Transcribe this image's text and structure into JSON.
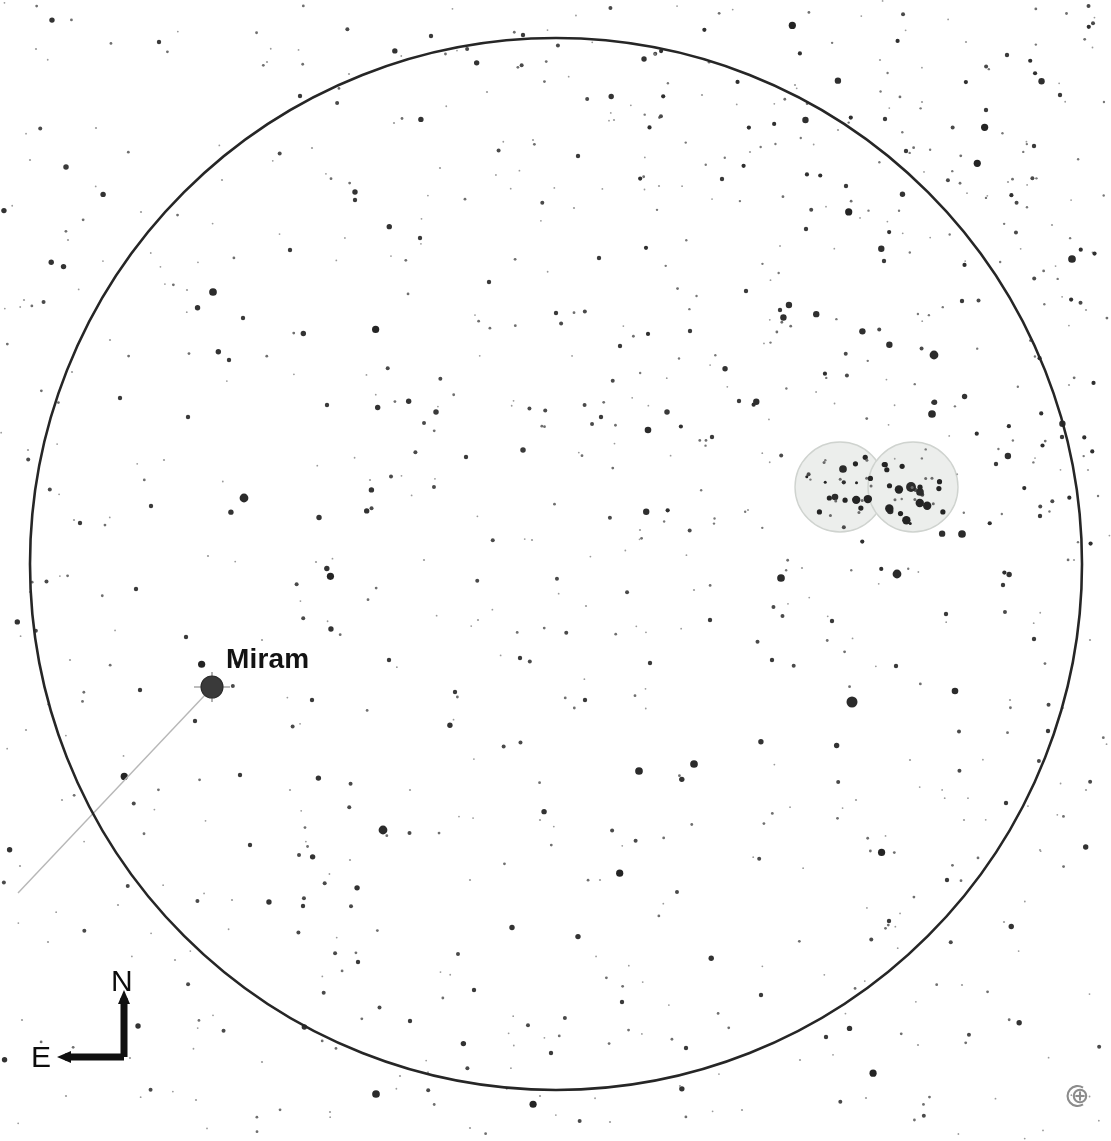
{
  "chart": {
    "type": "star-chart",
    "title_cut_off": "A simple chart of the region, projected looking up",
    "background_color": "#ffffff",
    "ink_color": "#1a1a1a",
    "field_of_view_circle": {
      "label": "field-of-view-circle",
      "center_x": 556,
      "center_y": 564,
      "radius": 526,
      "stroke_color": "#262626",
      "stroke_width": 2.6
    },
    "labeled_stars": [
      {
        "name": "Miram",
        "x": 212,
        "y": 687,
        "radius": 11,
        "magnitude_rank": 1,
        "has_spikes": true,
        "color": "#3a3a3a"
      }
    ],
    "constellation_lines": [
      {
        "name": "miram-line",
        "x1": 205,
        "y1": 695,
        "x2": 18,
        "y2": 893,
        "color": "#b7b7b7",
        "width": 1.4
      }
    ],
    "deep_sky_objects": [
      {
        "name": "open-cluster-west",
        "shape": "circle",
        "x": 840,
        "y": 487,
        "radius": 45,
        "fill": "#eceeec",
        "stroke": "#cfd3cf"
      },
      {
        "name": "open-cluster-east",
        "shape": "circle",
        "x": 913,
        "y": 487,
        "radius": 45,
        "fill": "#eceeec",
        "stroke": "#cfd3cf"
      }
    ],
    "compass": {
      "north_label": "N",
      "east_label": "E",
      "corner_x": 124,
      "corner_y": 1057,
      "north_tip_y": 990,
      "east_tip_x": 57,
      "stroke_color": "#101010",
      "stroke_width": 7
    },
    "zoom_icon": {
      "name": "zoom-target-icon",
      "glyph": "target-plus",
      "color": "#8c8c8c"
    },
    "star_field": {
      "description": "Monochrome plotted star field; dot radius encodes magnitude.",
      "dot_color": "#2b2b2b",
      "faint_dot_color": "#9a9a9a",
      "count": 620
    }
  },
  "chart_data": {
    "type": "scatter",
    "xlabel": "Right Ascension (E left)",
    "ylabel": "Declination (N up)",
    "grid": false,
    "legend": "none",
    "xlim": [
      0,
      1111
    ],
    "ylim": [
      0,
      1141
    ],
    "annotations": [
      "Miram",
      "N",
      "E"
    ],
    "series": [
      {
        "name": "bright-stars",
        "marker": "filled-circle",
        "points": [
          [
            212,
            687,
            11
          ],
          [
            852,
            702,
            10
          ],
          [
            383,
            830,
            8
          ],
          [
            897,
            574,
            8
          ],
          [
            781,
            578,
            7
          ],
          [
            934,
            355,
            8
          ],
          [
            932,
            414,
            7
          ],
          [
            694,
            764,
            7
          ],
          [
            639,
            771,
            7
          ],
          [
            1072,
            259,
            7
          ],
          [
            244,
            498,
            8
          ],
          [
            213,
            292,
            7
          ],
          [
            376,
            1094,
            7
          ],
          [
            962,
            534,
            7
          ],
          [
            955,
            691,
            6
          ],
          [
            648,
            430,
            6
          ],
          [
            843,
            469,
            7
          ],
          [
            911,
            487,
            9
          ],
          [
            920,
            492,
            7
          ],
          [
            835,
            497,
            6
          ]
        ]
      },
      {
        "name": "medium-stars",
        "marker": "filled-circle",
        "points": [
          [
            66,
            167,
            5
          ],
          [
            159,
            42,
            4
          ],
          [
            229,
            360,
            4
          ],
          [
            327,
            405,
            4
          ],
          [
            436,
            412,
            5
          ],
          [
            466,
            457,
            4
          ],
          [
            523,
            450,
            5
          ],
          [
            601,
            417,
            4
          ],
          [
            667,
            412,
            5
          ],
          [
            712,
            437,
            4
          ],
          [
            739,
            401,
            4
          ],
          [
            780,
            310,
            4
          ],
          [
            722,
            179,
            4
          ],
          [
            846,
            186,
            4
          ],
          [
            885,
            119,
            4
          ],
          [
            906,
            151,
            4
          ],
          [
            986,
            110,
            4
          ],
          [
            1007,
            55,
            4
          ],
          [
            1034,
            146,
            4
          ],
          [
            1060,
            95,
            4
          ],
          [
            599,
            258,
            4
          ],
          [
            578,
            156,
            4
          ],
          [
            523,
            35,
            4
          ],
          [
            431,
            36,
            4
          ],
          [
            300,
            96,
            4
          ],
          [
            120,
            398,
            4
          ],
          [
            80,
            523,
            4
          ],
          [
            186,
            637,
            4
          ],
          [
            140,
            690,
            4
          ],
          [
            250,
            845,
            4
          ],
          [
            303,
            906,
            4
          ],
          [
            358,
            962,
            4
          ],
          [
            410,
            1021,
            4
          ],
          [
            474,
            990,
            4
          ],
          [
            551,
            1053,
            4
          ],
          [
            622,
            1002,
            4
          ],
          [
            686,
            1048,
            4
          ],
          [
            761,
            995,
            4
          ],
          [
            826,
            1037,
            4
          ],
          [
            889,
            921,
            4
          ],
          [
            947,
            880,
            4
          ],
          [
            1006,
            803,
            4
          ],
          [
            1048,
            731,
            4
          ],
          [
            1034,
            639,
            4
          ],
          [
            996,
            464,
            4
          ],
          [
            962,
            301,
            4
          ],
          [
            884,
            261,
            4
          ],
          [
            806,
            229,
            4
          ],
          [
            746,
            291,
            4
          ],
          [
            690,
            331,
            4
          ],
          [
            620,
            346,
            4
          ],
          [
            556,
            313,
            4
          ],
          [
            489,
            282,
            4
          ],
          [
            420,
            238,
            4
          ],
          [
            355,
            200,
            4
          ],
          [
            290,
            250,
            4
          ],
          [
            243,
            318,
            4
          ],
          [
            188,
            417,
            4
          ],
          [
            151,
            506,
            4
          ],
          [
            136,
            589,
            4
          ],
          [
            195,
            721,
            4
          ],
          [
            240,
            775,
            4
          ],
          [
            312,
            700,
            4
          ],
          [
            389,
            660,
            4
          ],
          [
            455,
            692,
            4
          ],
          [
            520,
            658,
            4
          ],
          [
            585,
            700,
            4
          ],
          [
            650,
            663,
            4
          ],
          [
            710,
            620,
            4
          ],
          [
            772,
            660,
            4
          ],
          [
            832,
            621,
            4
          ],
          [
            896,
            666,
            4
          ],
          [
            946,
            614,
            4
          ],
          [
            1003,
            585,
            4
          ],
          [
            1040,
            516,
            4
          ],
          [
            1062,
            437,
            4
          ]
        ]
      },
      {
        "name": "faint-stars",
        "marker": "dot",
        "points": [
          [
            36,
            49,
            2
          ],
          [
            96,
            128,
            2
          ],
          [
            141,
            212,
            2
          ],
          [
            187,
            290,
            2
          ],
          [
            222,
            180,
            2
          ],
          [
            267,
            62,
            2
          ],
          [
            312,
            148,
            2
          ],
          [
            349,
            74,
            2
          ],
          [
            394,
            123,
            2
          ],
          [
            440,
            168,
            2
          ],
          [
            487,
            92,
            2
          ],
          [
            533,
            140,
            2
          ],
          [
            574,
            208,
            2
          ],
          [
            614,
            120,
            2
          ],
          [
            659,
            186,
            2
          ],
          [
            702,
            95,
            2
          ],
          [
            750,
            152,
            2
          ],
          [
            795,
            85,
            2
          ],
          [
            838,
            130,
            2
          ],
          [
            880,
            60,
            2
          ],
          [
            922,
            102,
            2
          ],
          [
            966,
            42,
            2
          ],
          [
            1008,
            182,
            2
          ],
          [
            1052,
            225,
            2
          ],
          [
            1086,
            310,
            2
          ],
          [
            1069,
            385,
            2
          ],
          [
            1088,
            470,
            2
          ],
          [
            1074,
            560,
            2
          ],
          [
            1090,
            640,
            2
          ],
          [
            1063,
            708,
            2
          ],
          [
            1086,
            790,
            2
          ],
          [
            1040,
            850,
            2
          ],
          [
            1004,
            922,
            2
          ],
          [
            962,
            985,
            2
          ],
          [
            918,
            1045,
            2
          ],
          [
            866,
            1098,
            2
          ],
          [
            800,
            1060,
            2
          ],
          [
            742,
            1110,
            2
          ],
          [
            680,
            1086,
            2
          ],
          [
            610,
            1122,
            2
          ],
          [
            540,
            1096,
            2
          ],
          [
            470,
            1128,
            2
          ],
          [
            400,
            1076,
            2
          ],
          [
            330,
            1112,
            2
          ],
          [
            262,
            1062,
            2
          ],
          [
            196,
            1100,
            2
          ],
          [
            130,
            1058,
            2
          ],
          [
            66,
            1096,
            2
          ],
          [
            22,
            1020,
            2
          ],
          [
            48,
            942,
            2
          ],
          [
            20,
            866,
            2
          ],
          [
            62,
            800,
            2
          ],
          [
            26,
            730,
            2
          ],
          [
            70,
            660,
            2
          ],
          [
            30,
            592,
            2
          ],
          [
            74,
            520,
            2
          ],
          [
            28,
            450,
            2
          ],
          [
            72,
            372,
            2
          ],
          [
            24,
            300,
            2
          ],
          [
            68,
            240,
            2
          ],
          [
            30,
            160,
            2
          ],
          [
            110,
            340,
            2
          ],
          [
            164,
            460,
            2
          ],
          [
            208,
            556,
            2
          ],
          [
            262,
            640,
            2
          ],
          [
            316,
            562,
            2
          ],
          [
            370,
            480,
            2
          ],
          [
            424,
            560,
            2
          ],
          [
            478,
            620,
            2
          ],
          [
            532,
            540,
            2
          ],
          [
            586,
            606,
            2
          ],
          [
            640,
            530,
            2
          ],
          [
            694,
            590,
            2
          ],
          [
            748,
            510,
            2
          ],
          [
            802,
            568,
            2
          ],
          [
            856,
            800,
            2
          ],
          [
            910,
            760,
            2
          ],
          [
            964,
            820,
            2
          ],
          [
            1010,
            700,
            2
          ],
          [
            600,
            880,
            2
          ],
          [
            540,
            820,
            2
          ],
          [
            470,
            880,
            2
          ],
          [
            410,
            790,
            2
          ],
          [
            350,
            860,
            2
          ],
          [
            290,
            790,
            2
          ],
          [
            232,
            900,
            2
          ],
          [
            175,
            960,
            2
          ],
          [
            118,
            905,
            2
          ]
        ]
      }
    ]
  }
}
